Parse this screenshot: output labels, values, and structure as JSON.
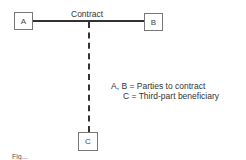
{
  "diagram": {
    "contract_label": "Contract",
    "nodes": [
      {
        "id": "A",
        "label": "A"
      },
      {
        "id": "B",
        "label": "B"
      },
      {
        "id": "C",
        "label": "C"
      }
    ],
    "edges": [
      {
        "from": "A",
        "to": "B",
        "style": "solid",
        "label": "Contract"
      },
      {
        "from": "contract-line",
        "to": "C",
        "style": "dashed"
      }
    ],
    "legend": [
      "A, B = Parties to contract",
      "C = Third-part beneficiary"
    ],
    "caption": "Fig..."
  }
}
